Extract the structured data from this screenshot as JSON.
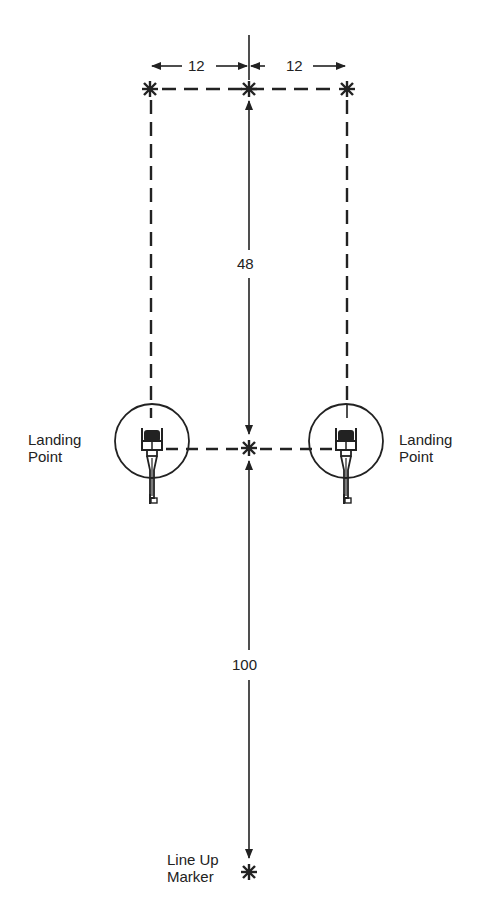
{
  "diagram": {
    "dimensions": {
      "left_offset": "12",
      "right_offset": "12",
      "forward_distance": "48",
      "lineup_distance": "100"
    },
    "labels": {
      "left_landing": [
        "Landing",
        "Point"
      ],
      "right_landing": [
        "Landing",
        "Point"
      ],
      "lineup_marker": [
        "Line Up",
        "Marker"
      ]
    },
    "markers": {
      "top_left": "asterisk",
      "top_center": "asterisk",
      "top_right": "asterisk",
      "center": "asterisk",
      "lineup": "asterisk"
    },
    "colors": {
      "ink": "#222222",
      "background": "#ffffff"
    }
  }
}
